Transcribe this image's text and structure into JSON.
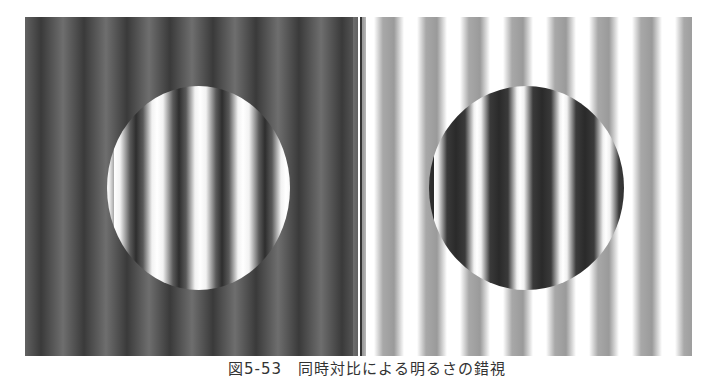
{
  "figure": {
    "caption": "図5-53　同時対比による明るさの錯視",
    "panels": [
      {
        "id": "left",
        "background": "dark vertical sinusoidal grating",
        "disc": "high-contrast grating (white/dark) in circular patch"
      },
      {
        "id": "right",
        "background": "light vertical sinusoidal grating (white/gray)",
        "disc": "high-contrast grating (dark/white) in circular patch"
      }
    ],
    "colors": {
      "left_background_dark": "#3a3a3a",
      "left_background_light": "#6e6e6e",
      "right_background_gray": "#a0a0a0",
      "right_background_white": "#ffffff",
      "disc_white": "#ffffff",
      "disc_dark": "#2e2e2e"
    }
  }
}
